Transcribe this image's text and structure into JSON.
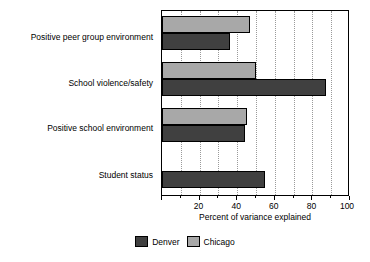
{
  "chart_data": {
    "type": "bar",
    "orientation": "horizontal",
    "title": "",
    "xlabel": "Percent of variance explained",
    "ylabel": "",
    "xlim": [
      0,
      100
    ],
    "xticks": [
      0,
      20,
      40,
      60,
      80,
      100
    ],
    "xtick_labels": [
      "",
      "20",
      "40",
      "60",
      "80",
      "100"
    ],
    "minor_tick_step": 10,
    "grid": "vertical-dotted",
    "legend_position": "bottom-center",
    "categories": [
      "Positive peer group environment",
      "School violence/safety",
      "Positive school environment",
      "Student status"
    ],
    "series": [
      {
        "name": "Denver",
        "color": "#404040",
        "values": [
          36,
          87,
          44,
          55
        ]
      },
      {
        "name": "Chicago",
        "color": "#a8a8a8",
        "values": [
          47,
          50,
          45,
          null
        ]
      }
    ]
  },
  "legend": {
    "items": [
      {
        "label": "Denver",
        "swatch": "denver"
      },
      {
        "label": "Chicago",
        "swatch": "chicago"
      }
    ]
  }
}
